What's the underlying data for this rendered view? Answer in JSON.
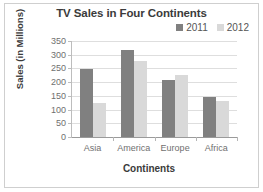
{
  "chart_data": {
    "type": "bar",
    "title": "TV Sales in Four Continents",
    "xlabel": "Continents",
    "ylabel": "Sales (in Millions)",
    "categories": [
      "Asia",
      "America",
      "Europe",
      "Africa"
    ],
    "series": [
      {
        "name": "2011",
        "values": [
          248,
          318,
          207,
          147
        ],
        "color": "#808080"
      },
      {
        "name": "2012",
        "values": [
          125,
          278,
          227,
          133
        ],
        "color": "#d9d9d9"
      }
    ],
    "ylim": [
      0,
      350
    ],
    "yticks": [
      0,
      50,
      100,
      150,
      200,
      250,
      300,
      350
    ],
    "ytick_labels": [
      "0",
      "50",
      "100",
      "150",
      "200",
      "250",
      "300",
      "350"
    ],
    "grid": true,
    "legend_position": "top-right"
  }
}
